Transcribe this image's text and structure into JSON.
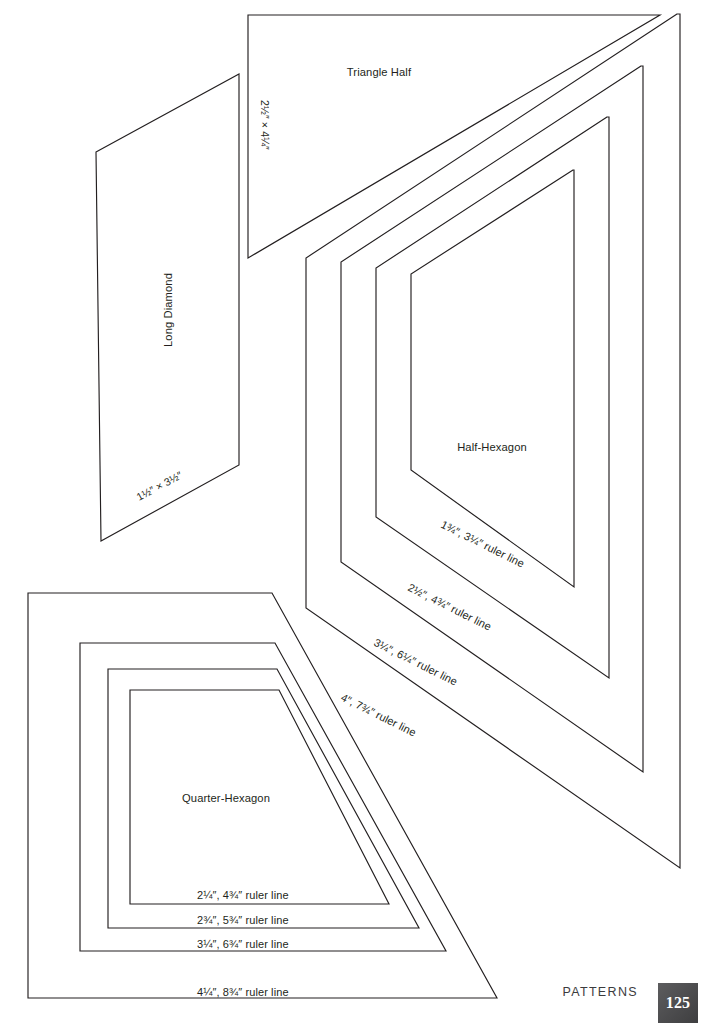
{
  "page": {
    "kind": "quilting-pattern-template-page",
    "background_color": "#ffffff",
    "ink_color": "#231f20",
    "width": 706,
    "height": 1031
  },
  "footer": {
    "section_label": "PATTERNS",
    "page_number": "125",
    "badge_color": "#4a4a4c",
    "badge_text_color": "#ffffff"
  },
  "templates": {
    "triangle_half": {
      "name": "Triangle Half",
      "dimension_label": "2½″ × 4¼″"
    },
    "long_diamond": {
      "name": "Long Diamond",
      "dimension_label": "1½″ × 3½″"
    },
    "half_hexagon": {
      "name": "Half-Hexagon",
      "ruler_lines": [
        "1¾″, 3¼″ ruler line",
        "2½″, 4¾″ ruler line",
        "3¼″, 6¼″ ruler line",
        "4″, 7¾″ ruler line"
      ]
    },
    "quarter_hexagon": {
      "name": "Quarter-Hexagon",
      "ruler_lines": [
        "2¼″, 4¾″ ruler line",
        "2¾″, 5¾″ ruler line",
        "3¼″, 6¾″ ruler line",
        "4¼″, 8¾″ ruler line"
      ]
    }
  }
}
